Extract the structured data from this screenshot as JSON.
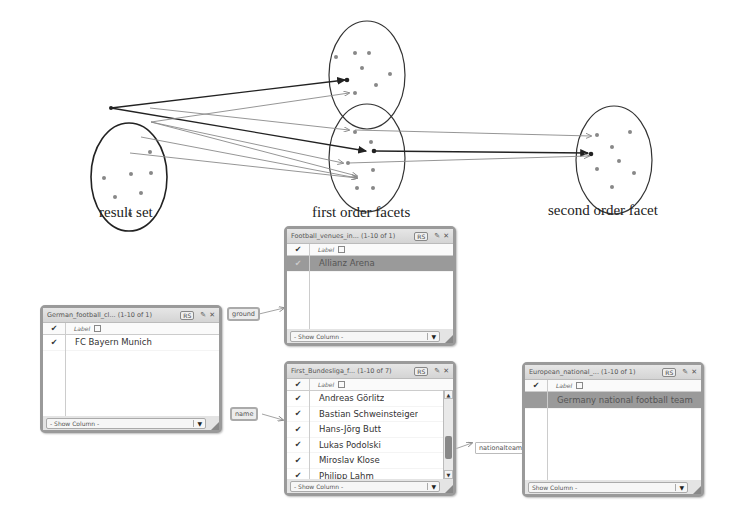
{
  "diagram": {
    "captions": {
      "result_set": "result set",
      "first_order": "first order facets",
      "second_order": "second order facet"
    },
    "colors": {
      "stroke_dark": "#222222",
      "stroke_light": "#8a8a8a",
      "dot": "#8a8a8a"
    }
  },
  "facets": {
    "german_clubs": {
      "title": "German_football_cl... (1-10 of 1)",
      "rs": "RS",
      "pin": "📌",
      "close": "✕",
      "column_label": "Label",
      "rows": [
        {
          "label": "FC Bayern Munich",
          "checked": true,
          "selected": false
        }
      ],
      "show_column": "- Show Column -"
    },
    "football_venues": {
      "title": "Football_venues_in... (1-10 of 1)",
      "rs": "RS",
      "pin": "📌",
      "close": "✕",
      "column_label": "Label",
      "rows": [
        {
          "label": "Allianz Arena",
          "checked": true,
          "selected": true
        }
      ],
      "show_column": "- Show Column -"
    },
    "bundesliga_players": {
      "title": "First_Bundesliga_f... (1-10 of 7)",
      "rs": "RS",
      "pin": "📌",
      "close": "✕",
      "column_label": "Label",
      "rows": [
        {
          "label": "Andreas Görlitz",
          "checked": true
        },
        {
          "label": "Bastian Schweinsteiger",
          "checked": true
        },
        {
          "label": "Hans-Jörg Butt",
          "checked": true
        },
        {
          "label": "Lukas Podolski",
          "checked": true
        },
        {
          "label": "Miroslav Klose",
          "checked": true
        },
        {
          "label": "Philipp Lahm",
          "checked": true
        }
      ],
      "show_column": "- Show Column -"
    },
    "european_national": {
      "title": "European_national_... (1-10 of 1)",
      "rs": "RS",
      "pin": "📌",
      "close": "✕",
      "column_label": "Label",
      "rows": [
        {
          "label": "Germany national football team",
          "checked": false,
          "selected": true
        }
      ],
      "show_column": "Show Column -"
    }
  },
  "edges": {
    "ground": "ground",
    "name": "name",
    "nationalteam": "nationalteam"
  },
  "icons": {
    "check": "✔",
    "sort": "sort-box-icon",
    "dropdown": "▼",
    "scroll_up": "▲",
    "scroll_down": "▼"
  }
}
